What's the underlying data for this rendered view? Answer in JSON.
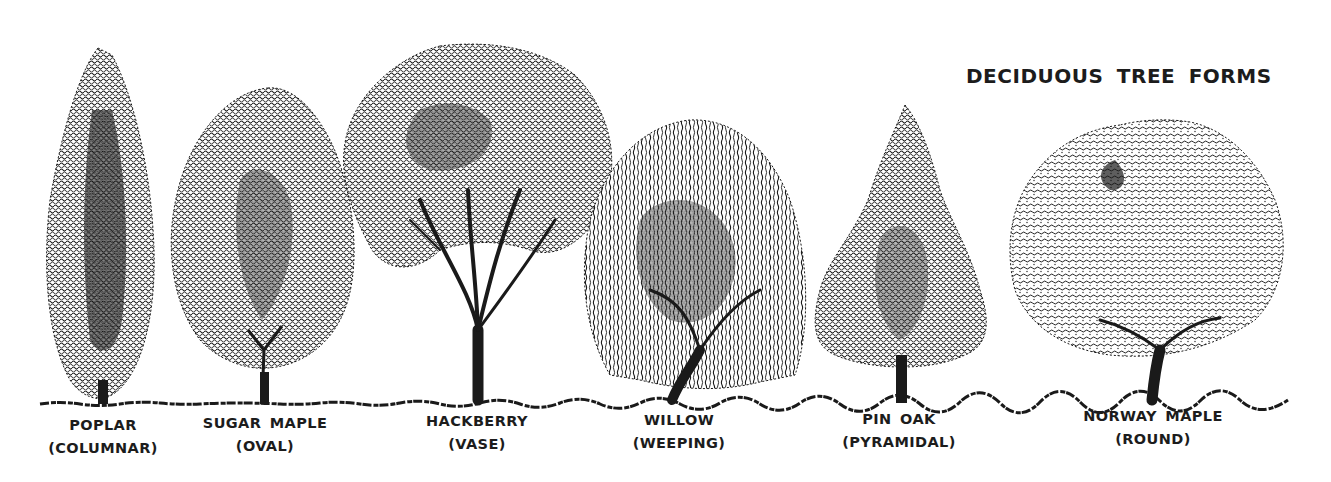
{
  "title": "DECIDUOUS TREE FORMS",
  "colors": {
    "background": "#ffffff",
    "ink": "#1a1a1a"
  },
  "trees": [
    {
      "name": "POPLAR",
      "form": "(COLUMNAR)",
      "shape": "columnar",
      "label_x": 103
    },
    {
      "name": "SUGAR MAPLE",
      "form": "(OVAL)",
      "shape": "oval",
      "label_x": 265
    },
    {
      "name": "HACKBERRY",
      "form": "(VASE)",
      "shape": "vase",
      "label_x": 477
    },
    {
      "name": "WILLOW",
      "form": "(WEEPING)",
      "shape": "weeping",
      "label_x": 679
    },
    {
      "name": "PIN OAK",
      "form": "(PYRAMIDAL)",
      "shape": "pyramidal",
      "label_x": 899
    },
    {
      "name": "NORWAY MAPLE",
      "form": "(ROUND)",
      "shape": "round",
      "label_x": 1153
    }
  ]
}
